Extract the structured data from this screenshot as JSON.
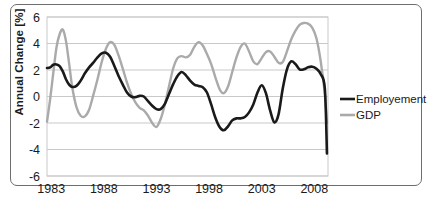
{
  "figure": {
    "caption": ""
  },
  "axes": {
    "ylabel": "Annual Change [%]",
    "yticks": [
      "-6",
      "-4",
      "-2",
      "0",
      "2",
      "4",
      "6"
    ],
    "xticks": [
      "1983",
      "1988",
      "1993",
      "1998",
      "2003",
      "2008"
    ]
  },
  "legend": {
    "items": [
      {
        "label": "Employement",
        "color": "#1a1a1a"
      },
      {
        "label": "GDP",
        "color": "#aaaaaa"
      }
    ]
  },
  "colors": {
    "employment": "#1a1a1a",
    "gdp": "#aaaaaa",
    "grid": "#c9c9c9",
    "frame": "#6e6e6e"
  },
  "chart_data": {
    "type": "line",
    "title": "",
    "xlabel": "",
    "ylabel": "Annual Change [%]",
    "xlim": [
      1982.6,
      2009.3
    ],
    "ylim": [
      -6,
      6
    ],
    "grid": true,
    "legend_position": "right",
    "xticks": [
      1983,
      1988,
      1993,
      1998,
      2003,
      2008
    ],
    "yticks": [
      -6,
      -4,
      -2,
      0,
      2,
      4,
      6
    ],
    "x": [
      1982.6,
      1982.9,
      1983.2,
      1983.5,
      1983.8,
      1984.1,
      1984.4,
      1984.7,
      1985.0,
      1985.4,
      1985.8,
      1986.2,
      1986.6,
      1987.0,
      1987.4,
      1987.8,
      1988.2,
      1988.6,
      1989.0,
      1989.4,
      1989.8,
      1990.2,
      1990.6,
      1991.0,
      1991.4,
      1991.8,
      1992.2,
      1992.6,
      1993.0,
      1993.4,
      1993.8,
      1994.2,
      1994.6,
      1995.0,
      1995.4,
      1995.8,
      1996.2,
      1996.6,
      1997.0,
      1997.4,
      1997.8,
      1998.2,
      1998.6,
      1999.0,
      1999.4,
      1999.8,
      2000.2,
      2000.6,
      2001.0,
      2001.4,
      2001.8,
      2002.2,
      2002.6,
      2003.0,
      2003.4,
      2003.8,
      2004.2,
      2004.6,
      2005.0,
      2005.4,
      2005.8,
      2006.2,
      2006.6,
      2007.0,
      2007.4,
      2007.8,
      2008.2,
      2008.6,
      2009.0,
      2009.2
    ],
    "series": [
      {
        "name": "Employement",
        "color": "#1a1a1a",
        "values": [
          2.15,
          2.2,
          2.4,
          2.42,
          2.3,
          1.9,
          1.3,
          0.9,
          0.72,
          0.8,
          1.2,
          1.75,
          2.2,
          2.55,
          2.95,
          3.25,
          3.3,
          3.0,
          2.3,
          1.55,
          0.9,
          0.3,
          0.0,
          -0.05,
          0.05,
          0.0,
          -0.35,
          -0.7,
          -0.95,
          -0.95,
          -0.55,
          0.2,
          0.95,
          1.55,
          1.85,
          1.6,
          1.2,
          0.9,
          0.8,
          0.7,
          0.3,
          -0.6,
          -1.6,
          -2.3,
          -2.55,
          -2.25,
          -1.8,
          -1.65,
          -1.65,
          -1.55,
          -1.2,
          -0.6,
          0.3,
          0.85,
          0.25,
          -1.05,
          -1.95,
          -1.35,
          0.6,
          2.05,
          2.65,
          2.45,
          2.05,
          2.05,
          2.2,
          2.25,
          2.1,
          1.7,
          0.6,
          -4.3
        ]
      },
      {
        "name": "GDP",
        "color": "#aaaaaa",
        "values": [
          -1.9,
          -0.2,
          1.8,
          3.7,
          4.7,
          5.05,
          4.2,
          2.5,
          0.7,
          -0.8,
          -1.45,
          -1.5,
          -1.0,
          0.1,
          1.3,
          2.6,
          3.6,
          4.1,
          3.9,
          3.1,
          2.1,
          1.05,
          0.2,
          -0.45,
          -0.85,
          -1.05,
          -1.45,
          -2.0,
          -2.3,
          -1.7,
          -0.6,
          0.8,
          2.15,
          2.9,
          3.05,
          2.95,
          3.15,
          3.75,
          4.1,
          3.85,
          3.2,
          2.45,
          1.45,
          0.55,
          0.25,
          0.75,
          1.85,
          2.95,
          3.75,
          4.0,
          3.4,
          2.65,
          2.45,
          2.9,
          3.35,
          3.4,
          3.0,
          2.55,
          2.6,
          3.4,
          4.3,
          4.95,
          5.4,
          5.55,
          5.5,
          5.2,
          4.4,
          2.7,
          0.2,
          -2.0
        ]
      }
    ]
  }
}
